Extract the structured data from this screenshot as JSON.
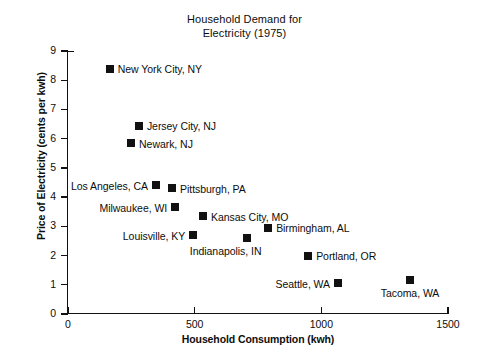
{
  "chart_data": {
    "type": "scatter",
    "title": "Household Demand for Electricity (1975)",
    "title_line1": "Household Demand for",
    "title_line2": "Electricity (1975)",
    "xlabel": "Household Consumption (kwh)",
    "ylabel": "Price of Electricity (cents per kwh)",
    "xlim": [
      0,
      1500
    ],
    "ylim": [
      0,
      9
    ],
    "xticks": [
      0,
      500,
      1000,
      1500
    ],
    "xtick_labels": [
      "0",
      "500",
      "1000",
      "1500"
    ],
    "yticks": [
      0,
      1,
      2,
      3,
      4,
      5,
      6,
      7,
      8,
      9
    ],
    "ytick_labels": [
      "0",
      "1",
      "2",
      "3",
      "4",
      "5",
      "6",
      "7",
      "8",
      "9"
    ],
    "grid": false,
    "legend": false,
    "marker_color": "#111111",
    "marker_shape": "square",
    "points": [
      {
        "label": "New York City, NY",
        "x": 165,
        "y": 8.4,
        "label_pos": "right"
      },
      {
        "label": "Jersey City, NJ",
        "x": 280,
        "y": 6.45,
        "label_pos": "right"
      },
      {
        "label": "Newark, NJ",
        "x": 249,
        "y": 5.85,
        "label_pos": "right"
      },
      {
        "label": "Los Angeles, CA",
        "x": 347,
        "y": 4.4,
        "label_pos": "left"
      },
      {
        "label": "Pittsburgh, PA",
        "x": 411,
        "y": 4.3,
        "label_pos": "right"
      },
      {
        "label": "Milwaukee, WI",
        "x": 423,
        "y": 3.65,
        "label_pos": "left"
      },
      {
        "label": "Kansas City, MO",
        "x": 533,
        "y": 3.35,
        "label_pos": "right"
      },
      {
        "label": "Birmingham, AL",
        "x": 790,
        "y": 2.95,
        "label_pos": "right"
      },
      {
        "label": "Louisville, KY",
        "x": 494,
        "y": 2.7,
        "label_pos": "left"
      },
      {
        "label": "Indianapolis, IN",
        "x": 707,
        "y": 2.6,
        "label_pos": "belowleft"
      },
      {
        "label": "Portland, OR",
        "x": 948,
        "y": 2.0,
        "label_pos": "right"
      },
      {
        "label": "Seattle, WA",
        "x": 1066,
        "y": 1.05,
        "label_pos": "left"
      },
      {
        "label": "Tacoma, WA",
        "x": 1350,
        "y": 1.15,
        "label_pos": "below"
      }
    ]
  }
}
